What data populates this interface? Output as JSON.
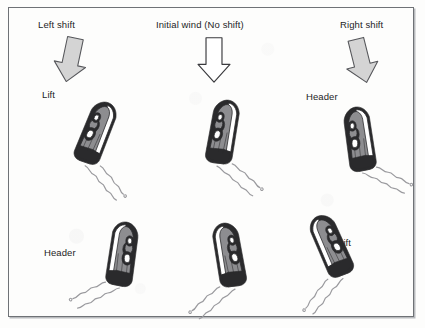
{
  "figure": {
    "border_color": "#6f7276",
    "background_color": "#fdfdfc",
    "ink_color": "#1d1d1f",
    "arrow_fill_shifted": "#d4d4d4",
    "arrow_fill_initial": "#ffffff",
    "hull_dark": "#2a2a2c",
    "hull_mid": "#8d8d90",
    "hull_light": "#ffffff",
    "wake_color": "#9a9a9e"
  },
  "wind_arrows": [
    {
      "id": "left-shift",
      "label": "Left shift",
      "style": "filled-gray",
      "direction": "down-right",
      "rotation_deg": 12
    },
    {
      "id": "initial-wind",
      "label": "Initial wind (No shift)",
      "style": "outline-white",
      "direction": "down",
      "rotation_deg": 0
    },
    {
      "id": "right-shift",
      "label": "Right shift",
      "style": "filled-gray",
      "direction": "down-left",
      "rotation_deg": -14
    }
  ],
  "boats": [
    {
      "id": "boat-top-left",
      "label": "Lift",
      "column": "left-shift",
      "row": "starboard-tack",
      "heading": "up-right",
      "rotation_deg": -18,
      "mirrored": false
    },
    {
      "id": "boat-top-center",
      "label": "",
      "column": "initial-wind",
      "row": "starboard-tack",
      "heading": "up-right",
      "rotation_deg": -30,
      "mirrored": false
    },
    {
      "id": "boat-top-right",
      "label": "Header",
      "column": "right-shift",
      "row": "starboard-tack",
      "heading": "up-right",
      "rotation_deg": -48,
      "mirrored": false
    },
    {
      "id": "boat-bottom-left",
      "label": "Header",
      "column": "left-shift",
      "row": "port-tack",
      "heading": "up-left",
      "rotation_deg": 48,
      "mirrored": true
    },
    {
      "id": "boat-bottom-center",
      "label": "",
      "column": "initial-wind",
      "row": "port-tack",
      "heading": "up-left",
      "rotation_deg": 30,
      "mirrored": true
    },
    {
      "id": "boat-bottom-right",
      "label": "Lift",
      "column": "right-shift",
      "row": "port-tack",
      "heading": "up-left",
      "rotation_deg": 16,
      "mirrored": true
    }
  ]
}
